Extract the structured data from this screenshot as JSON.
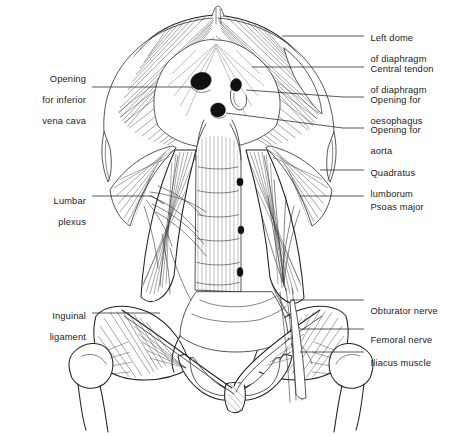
{
  "figure": {
    "style": "black-and-white line engraving",
    "background_color": "#ffffff",
    "ink_color": "#222222"
  },
  "labels_right": [
    {
      "id": "left-dome-of-diaphragm",
      "line1": "Left dome",
      "line2": "of diaphragm",
      "text_x": 365,
      "text_y": 27,
      "lead": [
        [
          343,
          36
        ],
        [
          364,
          36
        ]
      ]
    },
    {
      "id": "central-tendon-of-diaphragm",
      "line1": "Central tendon",
      "line2": "of diaphragm",
      "text_x": 365,
      "text_y": 58,
      "lead": [
        [
          343,
          67
        ],
        [
          364,
          67
        ]
      ]
    },
    {
      "id": "opening-for-oesophagus",
      "line1": "Opening for",
      "line2": "oesophagus",
      "text_x": 365,
      "text_y": 89,
      "lead": [
        [
          343,
          97
        ],
        [
          364,
          97
        ]
      ]
    },
    {
      "id": "opening-for-aorta",
      "line1": "Opening for",
      "line2": "aorta",
      "text_x": 365,
      "text_y": 120,
      "lead": [
        [
          343,
          128
        ],
        [
          364,
          128
        ]
      ]
    },
    {
      "id": "quadratus-lumborum",
      "line1": "Quadratus",
      "line2": "lumborum",
      "text_x": 365,
      "text_y": 155,
      "lead": [
        [
          343,
          170
        ],
        [
          364,
          170
        ]
      ]
    },
    {
      "id": "psoas-major",
      "line1": "Psoas major",
      "line2": "",
      "text_x": 365,
      "text_y": 192,
      "lead": [
        [
          343,
          196
        ],
        [
          364,
          196
        ]
      ]
    },
    {
      "id": "obturator-nerve",
      "line1": "Obturator nerve",
      "line2": "",
      "text_x": 365,
      "text_y": 296,
      "lead": [
        [
          343,
          300
        ],
        [
          364,
          300
        ]
      ]
    },
    {
      "id": "femoral-nerve",
      "line1": "Femoral nerve",
      "line2": "",
      "text_x": 365,
      "text_y": 325,
      "lead": [
        [
          343,
          329
        ],
        [
          364,
          329
        ]
      ]
    },
    {
      "id": "iliacus-muscle",
      "line1": "Iliacus muscle",
      "line2": "",
      "text_x": 365,
      "text_y": 348,
      "lead": [
        [
          343,
          352
        ],
        [
          364,
          352
        ]
      ]
    }
  ],
  "labels_left": [
    {
      "id": "opening-for-inferior-vena-cava",
      "line1": "Opening",
      "line2": "for inferior",
      "line3": "vena cava",
      "text_right_x": 86,
      "text_y": 68,
      "lead": [
        [
          92,
          87
        ],
        [
          205,
          87
        ]
      ]
    },
    {
      "id": "lumbar-plexus",
      "line1": "Lumbar",
      "line2": "plexus",
      "line3": "",
      "text_right_x": 86,
      "text_y": 186,
      "lead": [
        [
          92,
          196
        ],
        [
          152,
          196
        ]
      ]
    },
    {
      "id": "inguinal-ligament",
      "line1": "Inguinal",
      "line2": "ligament",
      "line3": "",
      "text_right_x": 86,
      "text_y": 302,
      "lead": [
        [
          92,
          313
        ],
        [
          160,
          313
        ]
      ]
    }
  ],
  "structures": [
    {
      "name": "diaphragm-dome-right",
      "region": "upper-left"
    },
    {
      "name": "diaphragm-dome-left",
      "region": "upper-right"
    },
    {
      "name": "central-tendon",
      "region": "upper-centre"
    },
    {
      "name": "caval-opening",
      "region": "centre",
      "cx": 201,
      "cy": 81,
      "rx": 10,
      "ry": 8
    },
    {
      "name": "oesophageal-opening",
      "region": "centre",
      "cx": 237,
      "cy": 88,
      "rx": 6,
      "ry": 9
    },
    {
      "name": "aortic-opening",
      "region": "centre",
      "cx": 218,
      "cy": 110,
      "rx": 7,
      "ry": 7
    },
    {
      "name": "lumbar-vertebral-column",
      "region": "centre"
    },
    {
      "name": "psoas-major-right",
      "region": "mid-left"
    },
    {
      "name": "psoas-major-left",
      "region": "mid-right"
    },
    {
      "name": "quadratus-lumborum-right",
      "region": "mid-left"
    },
    {
      "name": "quadratus-lumborum-left",
      "region": "mid-right"
    },
    {
      "name": "iliac-crest-right",
      "region": "lower-left"
    },
    {
      "name": "iliac-crest-left",
      "region": "lower-right"
    },
    {
      "name": "sacrum",
      "region": "lower-centre"
    },
    {
      "name": "pubic-symphysis",
      "region": "lower-centre"
    },
    {
      "name": "obturator-foramen-right",
      "region": "lower-left"
    },
    {
      "name": "obturator-foramen-left",
      "region": "lower-right"
    },
    {
      "name": "femur-head-right",
      "region": "lower-left"
    },
    {
      "name": "femur-head-left",
      "region": "lower-right"
    },
    {
      "name": "inguinal-ligament-right",
      "region": "lower-left"
    },
    {
      "name": "inguinal-ligament-left",
      "region": "lower-right"
    }
  ]
}
